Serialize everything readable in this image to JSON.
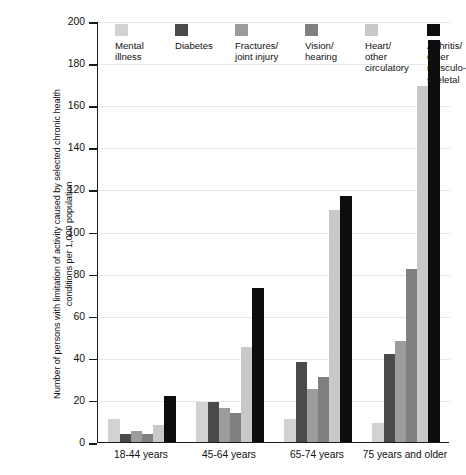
{
  "chart_data": {
    "type": "bar",
    "title": "",
    "xlabel": "",
    "ylabel": "Number of persons with limitation of activity caused by selected chronic health\nconditions per 1,000 population",
    "ylim": [
      0,
      200
    ],
    "ytick_step": 20,
    "yticks": [
      200,
      180,
      160,
      140,
      120,
      100,
      80,
      60,
      40,
      20,
      0
    ],
    "grid": true,
    "legend_position": "top-inside",
    "categories": [
      "18-44 years",
      "45-64 years",
      "65-74 years",
      "75 years and older"
    ],
    "series": [
      {
        "name": "Mental\nillness",
        "color": "#d2d2d2",
        "values": [
          11,
          19,
          11,
          9
        ]
      },
      {
        "name": "Diabetes",
        "color": "#4a4a4a",
        "values": [
          4,
          19,
          38,
          42
        ]
      },
      {
        "name": "Fractures/\njoint injury",
        "color": "#9c9c9c",
        "values": [
          5,
          16,
          25,
          48
        ]
      },
      {
        "name": "Vision/\nhearing",
        "color": "#808080",
        "values": [
          4,
          14,
          31,
          82
        ]
      },
      {
        "name": "Heart/\nother\ncirculatory",
        "color": "#c8c8c8",
        "values": [
          8,
          45,
          110,
          169
        ]
      },
      {
        "name": "Arthritis/\nother\nmusculo-\nskeletal",
        "color": "#0d0d0d",
        "values": [
          22,
          73,
          117,
          191
        ]
      }
    ]
  },
  "colors": {
    "axis": "#1a1a1a",
    "grid": "#e8e8e8",
    "background": "#ffffff",
    "text": "#111111"
  }
}
